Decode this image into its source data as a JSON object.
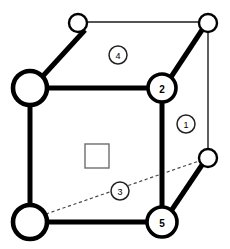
{
  "figure": {
    "width": 230,
    "height": 249,
    "background_color": "#ffffff",
    "stroke_color": "#000000",
    "thin_stroke_color": "#1a1a1a",
    "dashed_stroke_color": "#4a4a4a",
    "square_stroke_color": "#6e6e6e"
  },
  "nodes": [
    {
      "id": "top-back-left",
      "label": "",
      "cx": 78,
      "cy": 23,
      "r": 9,
      "size": "small"
    },
    {
      "id": "top-back-right",
      "label": "",
      "cx": 208,
      "cy": 23,
      "r": 9,
      "size": "small"
    },
    {
      "id": "top-front-left",
      "label": "",
      "cx": 30,
      "cy": 88,
      "r": 17,
      "size": "big"
    },
    {
      "id": "top-front-right",
      "label": "2",
      "cx": 162,
      "cy": 88,
      "r": 14,
      "size": "mid"
    },
    {
      "id": "bottom-back-right",
      "label": "",
      "cx": 208,
      "cy": 158,
      "r": 9,
      "size": "small"
    },
    {
      "id": "bottom-front-left",
      "label": "",
      "cx": 30,
      "cy": 222,
      "r": 17,
      "size": "big"
    },
    {
      "id": "bottom-front-right",
      "label": "5",
      "cx": 162,
      "cy": 222,
      "r": 15,
      "size": "mid"
    }
  ],
  "edges_thick": [
    {
      "id": "edge-topleft-to-backleft",
      "x1": 42,
      "y1": 77,
      "x2": 85,
      "y2": 30
    },
    {
      "id": "edge-node2-to-backright",
      "x1": 171,
      "y1": 77,
      "x2": 202,
      "y2": 30
    },
    {
      "id": "edge-top-front-horizontal",
      "x1": 46,
      "y1": 88,
      "x2": 149,
      "y2": 88
    },
    {
      "id": "edge-left-vertical",
      "x1": 30,
      "y1": 105,
      "x2": 30,
      "y2": 205
    },
    {
      "id": "edge-right-vertical",
      "x1": 162,
      "y1": 102,
      "x2": 162,
      "y2": 208
    },
    {
      "id": "edge-bottom-front-horizontal",
      "x1": 47,
      "y1": 222,
      "x2": 148,
      "y2": 222
    },
    {
      "id": "edge-node5-to-backright",
      "x1": 171,
      "y1": 211,
      "x2": 202,
      "y2": 165
    }
  ],
  "edges_thin": [
    {
      "id": "edge-top-back-horizontal",
      "x1": 87,
      "y1": 22,
      "x2": 199,
      "y2": 22
    },
    {
      "id": "edge-back-right-vertical",
      "x1": 208,
      "y1": 32,
      "x2": 208,
      "y2": 149
    }
  ],
  "edges_dashed": [
    {
      "id": "edge-diagonal-hidden",
      "x1": 46,
      "y1": 214,
      "x2": 199,
      "y2": 161
    }
  ],
  "face_square": {
    "id": "center-face-square",
    "x": 85,
    "y": 144,
    "width": 24,
    "height": 24
  },
  "tags": [
    {
      "id": "tag-1",
      "label": "1",
      "cx": 186,
      "cy": 124,
      "r": 9
    },
    {
      "id": "tag-3",
      "label": "3",
      "cx": 120,
      "cy": 191,
      "r": 9
    },
    {
      "id": "tag-4",
      "label": "4",
      "cx": 118,
      "cy": 55,
      "r": 9
    }
  ]
}
